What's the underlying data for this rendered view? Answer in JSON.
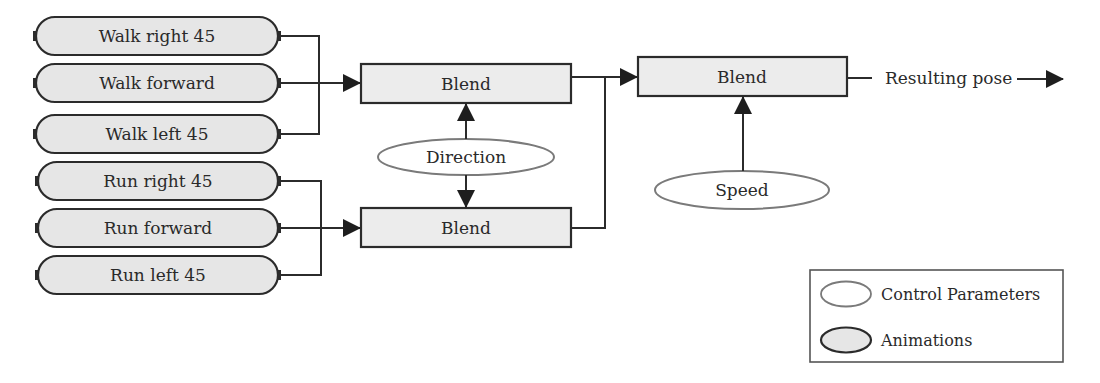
{
  "animations": [
    {
      "label": "Walk right 45"
    },
    {
      "label": "Walk forward"
    },
    {
      "label": "Walk left 45"
    },
    {
      "label": "Run right 45"
    },
    {
      "label": "Run forward"
    },
    {
      "label": "Run left 45"
    }
  ],
  "blend_nodes": [
    {
      "label": "Blend"
    },
    {
      "label": "Blend"
    },
    {
      "label": "Blend"
    }
  ],
  "control_parameters": [
    {
      "label": "Direction"
    },
    {
      "label": "Speed"
    }
  ],
  "output": {
    "label": "Resulting pose"
  },
  "legend": {
    "items": [
      {
        "label": "Control Parameters"
      },
      {
        "label": "Animations"
      }
    ]
  },
  "colors": {
    "stroke": "#2b2b2b",
    "fill_gray": "#e6e6e6",
    "control_stroke": "#7a7a7a"
  }
}
